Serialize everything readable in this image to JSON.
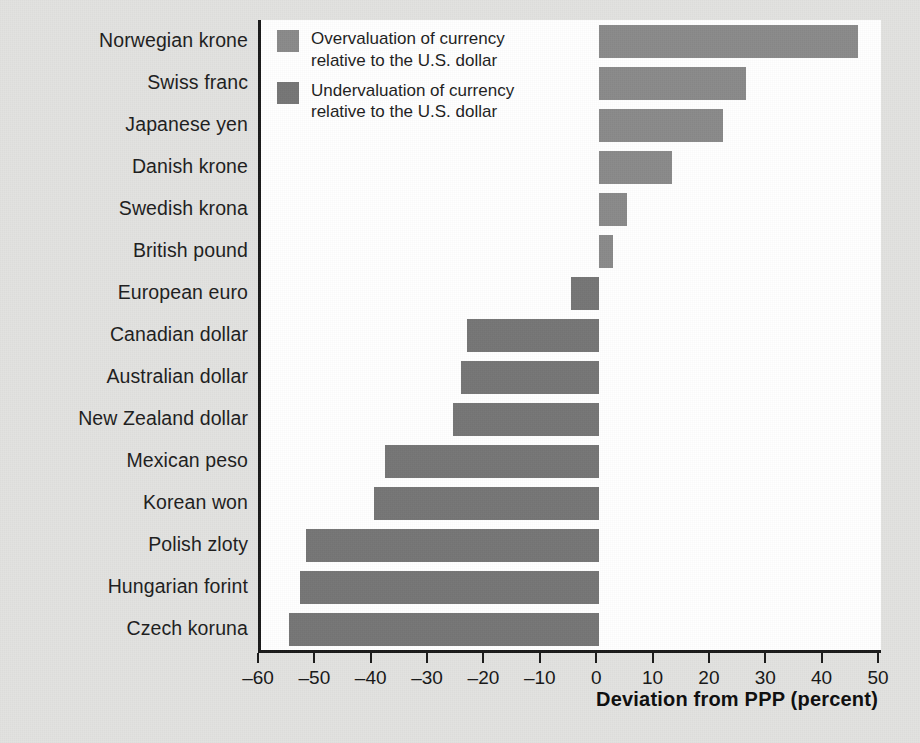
{
  "chart_data": {
    "type": "bar",
    "orientation": "horizontal",
    "title": "",
    "subtitle": "",
    "xlabel": "Deviation from PPP (percent)",
    "ylabel": "",
    "xlim": [
      -60,
      50
    ],
    "xticks": [
      -60,
      -50,
      -40,
      -30,
      -20,
      -10,
      0,
      10,
      20,
      30,
      40,
      50
    ],
    "xtick_labels": [
      "–60",
      "–50",
      "–40",
      "–30",
      "–20",
      "–10",
      "0",
      "10",
      "20",
      "30",
      "40",
      "50"
    ],
    "grid": false,
    "legend_position": "top-left inside plot",
    "categories": [
      "Norwegian krone",
      "Swiss franc",
      "Japanese yen",
      "Danish krone",
      "Swedish krona",
      "British pound",
      "European euro",
      "Canadian dollar",
      "Australian dollar",
      "New Zealand dollar",
      "Mexican peso",
      "Korean won",
      "Polish zloty",
      "Hungarian forint",
      "Czech koruna"
    ],
    "values": [
      46,
      26,
      22,
      13,
      5,
      2.5,
      -5,
      -23.5,
      -24.5,
      -26,
      -38,
      -40,
      -52,
      -53,
      -55
    ],
    "series": [
      {
        "name": "Deviation from PPP (percent)",
        "values": [
          46,
          26,
          22,
          13,
          5,
          2.5,
          -5,
          -23.5,
          -24.5,
          -26,
          -38,
          -40,
          -52,
          -53,
          -55
        ]
      }
    ],
    "legend": [
      {
        "label": "Overvaluation of currency\nrelative to the U.S. dollar",
        "color": "#8a8a8a"
      },
      {
        "label": "Undervaluation of currency\nrelative to the U.S. dollar",
        "color": "#757575"
      }
    ],
    "colors": {
      "bar_positive": "#8a8a8a",
      "bar_negative": "#757575",
      "bar": "#7e7e7e",
      "axis": "#1a1a1a",
      "plot_background": "#ffffff",
      "page_background": "#e2e2e0",
      "text": "#1d1d1d"
    }
  }
}
